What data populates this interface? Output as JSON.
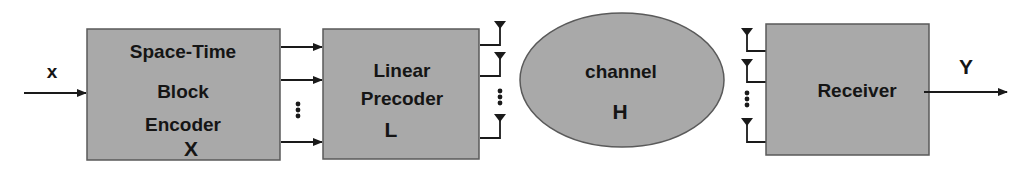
{
  "diagram": {
    "colors": {
      "block_fill": "#a9a9a9",
      "block_stroke": "#5a5a5a",
      "line": "#1a1a1a",
      "text": "#151515",
      "background": "#ffffff"
    },
    "input": {
      "label": "x"
    },
    "encoder": {
      "lines": [
        "Space-Time",
        "Block",
        "Encoder",
        "X"
      ]
    },
    "precoder": {
      "lines": [
        "Linear",
        "Precoder",
        "L"
      ]
    },
    "channel": {
      "lines": [
        "channel",
        "H"
      ]
    },
    "receiver": {
      "label": "Receiver"
    },
    "output": {
      "label": "Y"
    },
    "ellipsis_glyph": "⋮",
    "icons": {
      "arrow": "arrow-right-icon",
      "antenna": "antenna-icon",
      "dots": "vertical-ellipsis-icon"
    }
  }
}
